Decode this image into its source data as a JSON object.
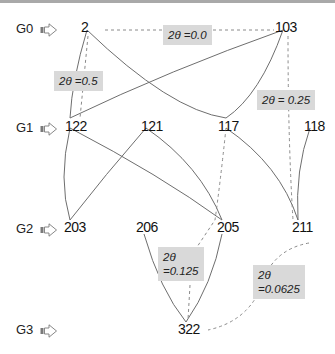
{
  "rows": [
    {
      "label": "G0"
    },
    {
      "label": "G1"
    },
    {
      "label": "G2"
    },
    {
      "label": "G3"
    }
  ],
  "nodes": {
    "n2": "2",
    "n103": "103",
    "n122": "122",
    "n121": "121",
    "n117": "117",
    "n118": "118",
    "n203": "203",
    "n206": "206",
    "n205": "205",
    "n211": "211",
    "n322": "322"
  },
  "angles": {
    "a00": "2θ =0.0",
    "a05": "2θ =0.5",
    "a025": "2θ = 0.25",
    "a0125_l1": "2θ",
    "a0125_l2": "=0.125",
    "a00625_l1": "2θ",
    "a00625_l2": "=0.0625"
  },
  "colors": {
    "edge": "#6e6e6e",
    "dashed_edge": "#8a8a8a",
    "angle_bg": "#d9d9d9",
    "top_border": "#a9a9a9"
  }
}
